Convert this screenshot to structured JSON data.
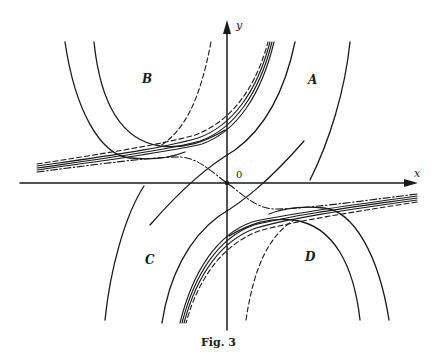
{
  "figure": {
    "caption": "Fig. 3",
    "axes": {
      "x_label": "x",
      "y_label": "y",
      "origin_label": "0"
    },
    "regions": [
      {
        "id": "A",
        "label": "A"
      },
      {
        "id": "B",
        "label": "B"
      },
      {
        "id": "C",
        "label": "C"
      },
      {
        "id": "D",
        "label": "D"
      }
    ],
    "curve_styles": [
      "solid",
      "dashed",
      "dash-dot"
    ],
    "colors": {
      "ink": "#1a1a1a",
      "background": "#ffffff"
    }
  }
}
